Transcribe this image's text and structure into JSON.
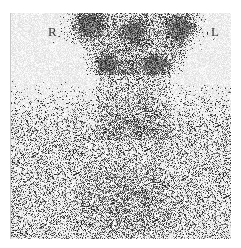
{
  "image": {
    "type": "nuclear-medicine-scintigraphy",
    "view": "anterior-neck",
    "labels": {
      "right": "R",
      "left": "L"
    },
    "background": "#ffffff",
    "frame": {
      "x": 10,
      "y": 13,
      "w": 221,
      "h": 226
    },
    "hotspots": [
      {
        "name": "upper-right-parotid",
        "x": 88,
        "y": 24,
        "rx": 17,
        "ry": 15,
        "intensity": 0.95
      },
      {
        "name": "upper-center",
        "x": 133,
        "y": 32,
        "rx": 15,
        "ry": 15,
        "intensity": 0.85
      },
      {
        "name": "upper-left-parotid",
        "x": 180,
        "y": 28,
        "rx": 16,
        "ry": 15,
        "intensity": 0.9
      },
      {
        "name": "right-submandibular",
        "x": 107,
        "y": 62,
        "rx": 11,
        "ry": 10,
        "intensity": 0.9
      },
      {
        "name": "left-submandibular",
        "x": 155,
        "y": 62,
        "rx": 11,
        "ry": 10,
        "intensity": 0.85
      }
    ]
  }
}
